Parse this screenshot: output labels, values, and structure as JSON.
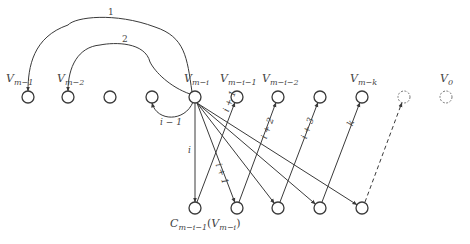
{
  "diagram": {
    "top_nodes": [
      {
        "id": "v_m_1",
        "label_main": "V",
        "label_sub": "m−1",
        "x": 28,
        "y": 97,
        "dashed": false
      },
      {
        "id": "v_m_2",
        "label_main": "V",
        "label_sub": "m−2",
        "x": 68,
        "y": 97,
        "dashed": false
      },
      {
        "id": "v_a",
        "label_main": "",
        "label_sub": "",
        "x": 110,
        "y": 97,
        "dashed": false
      },
      {
        "id": "v_b",
        "label_main": "",
        "label_sub": "",
        "x": 152,
        "y": 97,
        "dashed": false
      },
      {
        "id": "v_m_i",
        "label_main": "V",
        "label_sub": "m−i",
        "x": 195,
        "y": 97,
        "dashed": false
      },
      {
        "id": "v_m_i_1",
        "label_main": "V",
        "label_sub": "m−i−1",
        "x": 237,
        "y": 97,
        "dashed": false
      },
      {
        "id": "v_m_i_2",
        "label_main": "V",
        "label_sub": "m−i−2",
        "x": 278,
        "y": 97,
        "dashed": false
      },
      {
        "id": "v_c",
        "label_main": "",
        "label_sub": "",
        "x": 320,
        "y": 97,
        "dashed": false
      },
      {
        "id": "v_m_k",
        "label_main": "V",
        "label_sub": "m−k",
        "x": 362,
        "y": 97,
        "dashed": false
      },
      {
        "id": "v_d",
        "label_main": "",
        "label_sub": "",
        "x": 404,
        "y": 97,
        "dashed": true
      },
      {
        "id": "v_0",
        "label_main": "V",
        "label_sub": "0",
        "x": 446,
        "y": 97,
        "dashed": true
      }
    ],
    "bottom_nodes": [
      {
        "id": "c1",
        "x": 195,
        "y": 208
      },
      {
        "id": "c2",
        "x": 237,
        "y": 208
      },
      {
        "id": "c3",
        "x": 278,
        "y": 208
      },
      {
        "id": "c4",
        "x": 320,
        "y": 208
      },
      {
        "id": "c5",
        "x": 362,
        "y": 208
      }
    ],
    "bottom_label": {
      "main": "C",
      "sub": "m−i−1",
      "paren_main": "V",
      "paren_sub": "m−i"
    },
    "arc_labels": {
      "arc1": "1",
      "arc2": "2",
      "loop": "i − 1"
    },
    "edge_labels": {
      "i": "i",
      "i_plus_1_up": "i + 1",
      "i_plus_1_down": "i + 1",
      "i_plus_2": "i + 2",
      "i_plus_3": "i + 3",
      "k": "k"
    },
    "stroke_color": "#3a3a3a",
    "node_radius": 6
  }
}
